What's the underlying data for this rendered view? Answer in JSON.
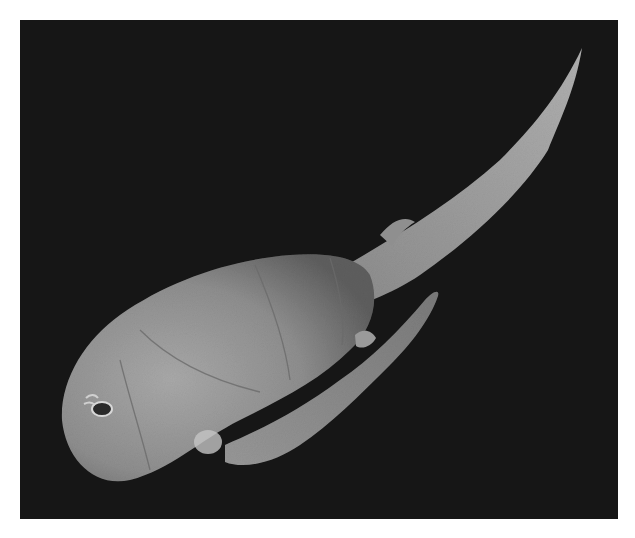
{
  "image": {
    "subject": "Fossil placoderm fish (antiarch) on black background",
    "alt": "Photograph of a fossilized armored fish with a long tapering tail and pectoral appendages, shown on a black background",
    "colors": {
      "border": "#ffffff",
      "background": "#161616",
      "fossil_light": "#b8b8b8",
      "fossil_mid": "#8c8c8c",
      "fossil_dark": "#5a5a5a"
    }
  }
}
